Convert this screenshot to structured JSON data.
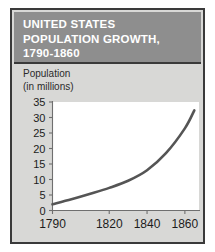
{
  "figure": {
    "title_lines": [
      "UNITED STATES",
      "POPULATION GROWTH,",
      "1790-1860"
    ],
    "title_bg_color": "#8e8e8e",
    "title_text_color": "#ffffff",
    "panel_bg_color": "#d8d8d6",
    "border_color": "#3a3a3a"
  },
  "chart_data": {
    "type": "line",
    "title": "UNITED STATES POPULATION GROWTH, 1790-1860",
    "ylabel_lines": [
      "Population",
      "(in millions)"
    ],
    "ylabel": "Population (in millions)",
    "xlabel": "",
    "x": [
      1790,
      1800,
      1810,
      1820,
      1830,
      1840,
      1850,
      1860,
      1865
    ],
    "values": [
      2.0,
      3.6,
      5.4,
      7.3,
      9.6,
      13.0,
      18.5,
      26.5,
      32.3
    ],
    "series": [
      {
        "name": "United States population",
        "values": [
          2.0,
          3.6,
          5.4,
          7.3,
          9.6,
          13.0,
          18.5,
          26.5,
          32.3
        ]
      }
    ],
    "xlim": [
      1790,
      1868
    ],
    "ylim": [
      0,
      35
    ],
    "yticks": [
      0,
      5,
      10,
      15,
      20,
      25,
      30,
      35
    ],
    "ytick_labels": [
      "0",
      "5",
      "10",
      "15",
      "20",
      "25",
      "30",
      "35"
    ],
    "xticks": [
      1790,
      1820,
      1840,
      1860
    ],
    "xtick_labels": [
      "1790",
      "1820",
      "1840",
      "1860"
    ],
    "grid": false,
    "legend": false,
    "line_color": "#555555",
    "plot_bg_color": "#ffffff"
  }
}
